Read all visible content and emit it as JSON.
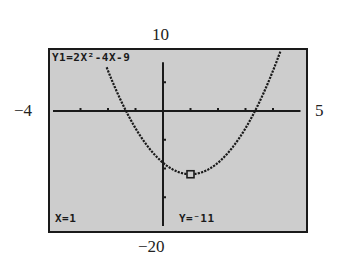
{
  "window": {
    "xmin": "−4",
    "xmax": "5",
    "ymin": "−20",
    "ymax": "10"
  },
  "screen": {
    "equation": "Y1=2X²-4X-9",
    "trace_x": "X=1",
    "trace_y": "Y=⁻11",
    "background_color": "#cdcdcd",
    "ink_color": "#1a1a1a"
  },
  "chart_data": {
    "type": "line",
    "title": "Y1=2X²-4X-9",
    "function": "y = 2x^2 - 4x - 9",
    "xlabel": "",
    "ylabel": "",
    "xlim": [
      -4,
      5
    ],
    "ylim": [
      -20,
      10
    ],
    "xscl": 1,
    "yscl": 5,
    "grid": false,
    "x_ticks": [
      -3,
      -2,
      -1,
      1,
      2,
      3,
      4
    ],
    "y_ticks": [
      5,
      -5,
      -10,
      -15
    ],
    "series": [
      {
        "name": "Y1",
        "x": [
          -2,
          -1.5,
          -1,
          -0.5,
          0,
          0.5,
          1,
          1.5,
          2,
          2.5,
          3,
          3.5,
          4,
          4.3
        ],
        "values": [
          7,
          0.5,
          -3,
          -6.5,
          -9,
          -10.5,
          -11,
          -10.5,
          -9,
          -6.5,
          -3,
          0.5,
          7,
          10.78
        ]
      }
    ],
    "trace_cursor": {
      "x": 1,
      "y": -11
    },
    "annotations": [
      "X=1",
      "Y=⁻11"
    ]
  }
}
